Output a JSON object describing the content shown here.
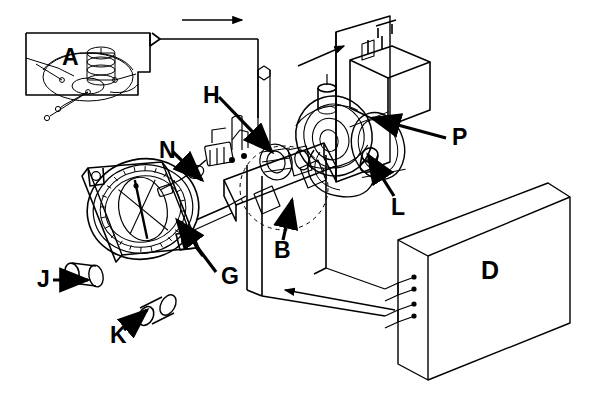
{
  "figure": {
    "background_color": "#ffffff",
    "line_color": "#000000",
    "label_color": "#000000",
    "width": 594,
    "height": 399
  },
  "callouts": [
    {
      "id": "A",
      "label": "A",
      "x": 62,
      "y": 46,
      "size": 23,
      "target": "inset-detail-box",
      "pointer": "none"
    },
    {
      "id": "H",
      "label": "H",
      "x": 203,
      "y": 84,
      "size": 23,
      "target": "central-mechanism",
      "pointer": "arrow-down-right"
    },
    {
      "id": "N",
      "label": "N",
      "x": 159,
      "y": 139,
      "size": 23,
      "target": "left-linkage-assembly",
      "pointer": "arrow-down-right"
    },
    {
      "id": "P",
      "label": "P",
      "x": 452,
      "y": 136,
      "size": 23,
      "target": "upper-right-housing",
      "pointer": "arrow-up-left"
    },
    {
      "id": "L",
      "label": "L",
      "x": 391,
      "y": 204,
      "size": 23,
      "target": "rotor-knob",
      "pointer": "arrow-up-left"
    },
    {
      "id": "B",
      "label": "B",
      "x": 274,
      "y": 247,
      "size": 23,
      "target": "mounting-plate",
      "pointer": "arrow-up-left"
    },
    {
      "id": "G",
      "label": "G",
      "x": 221,
      "y": 277,
      "size": 23,
      "target": "compass-dial",
      "pointer": "arrow-up-left"
    },
    {
      "id": "J",
      "label": "J",
      "x": 37,
      "y": 273,
      "size": 23,
      "target": "left-adjust-knob",
      "pointer": "arrow-right"
    },
    {
      "id": "K",
      "label": "K",
      "x": 110,
      "y": 332,
      "size": 23,
      "target": "lower-adjust-knob",
      "pointer": "arrow-up-right"
    },
    {
      "id": "D",
      "label": "D",
      "x": 481,
      "y": 267,
      "size": 25,
      "target": "enclosure-box",
      "pointer": "none"
    }
  ],
  "flow_arrows": [
    {
      "id": "top-left",
      "direction": "right",
      "from_x": 182,
      "from_y": 20,
      "to_x": 244,
      "to_y": 20
    },
    {
      "id": "top-right",
      "direction": "up-right",
      "from_x": 298,
      "from_y": 66,
      "to_x": 345,
      "to_y": 45
    },
    {
      "id": "bottom",
      "direction": "left",
      "from_x": 395,
      "from_y": 310,
      "to_x": 283,
      "to_y": 290
    }
  ],
  "components": [
    {
      "id": "inset-detail-box",
      "name": "detail-inset-frame",
      "kind": "callout-box"
    },
    {
      "id": "compass-instrument",
      "name": "compass-indicator",
      "kind": "instrument"
    },
    {
      "id": "compass-dial",
      "name": "graduated-compass-rose",
      "kind": "dial"
    },
    {
      "id": "left-adjust-knob",
      "name": "adjustment-knob-left",
      "kind": "knob"
    },
    {
      "id": "lower-adjust-knob",
      "name": "adjustment-knob-lower",
      "kind": "knob"
    },
    {
      "id": "left-linkage-assembly",
      "name": "linkage-assembly",
      "kind": "mechanism"
    },
    {
      "id": "central-mechanism",
      "name": "central-drive-mechanism",
      "kind": "mechanism"
    },
    {
      "id": "mounting-plate",
      "name": "angled-mounting-plate",
      "kind": "plate"
    },
    {
      "id": "upper-right-housing",
      "name": "upper-housing-block",
      "kind": "housing"
    },
    {
      "id": "rotor-knob",
      "name": "rotor-shaft-knob",
      "kind": "knob"
    },
    {
      "id": "enclosure-box",
      "name": "amplifier-enclosure",
      "kind": "enclosure"
    },
    {
      "id": "terminal-strip",
      "name": "wiring-terminals",
      "kind": "terminals"
    }
  ],
  "terminals": {
    "count": 4,
    "pairs": 2
  }
}
